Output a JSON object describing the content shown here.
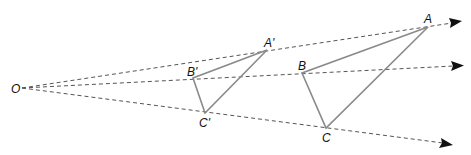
{
  "diagram": {
    "center": {
      "label": "O"
    },
    "image_triangle": {
      "vertices": [
        {
          "label": "A'"
        },
        {
          "label": "B'"
        },
        {
          "label": "C'"
        }
      ]
    },
    "original_triangle": {
      "vertices": [
        {
          "label": "A"
        },
        {
          "label": "B"
        },
        {
          "label": "C"
        }
      ]
    },
    "rays": [
      "ray-OA",
      "ray-OB",
      "ray-OC"
    ],
    "colors": {
      "triangle_stroke": "#8a8a8a",
      "ray_stroke": "#555555",
      "arrowhead": "#111111"
    }
  }
}
